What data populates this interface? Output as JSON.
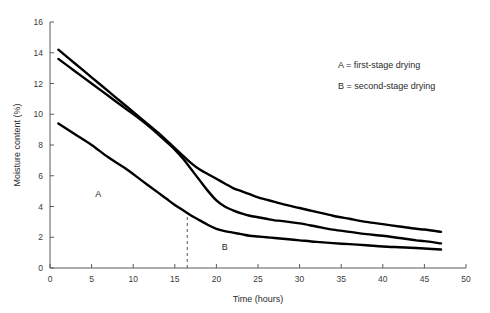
{
  "chart_data": {
    "type": "line",
    "title": "",
    "xlabel": "Time (hours)",
    "ylabel": "Moisture content (%)",
    "xlim": [
      0,
      50
    ],
    "ylim": [
      0,
      16
    ],
    "xticks": [
      0,
      5,
      10,
      15,
      20,
      25,
      30,
      35,
      40,
      45,
      50
    ],
    "xticklabels": [
      "0",
      "5",
      "10",
      "15",
      "20",
      "25",
      "30",
      "35",
      "40",
      "45",
      "50"
    ],
    "yticks": [
      0,
      2,
      4,
      6,
      8,
      10,
      12,
      14,
      16
    ],
    "yticklabels": [
      "0",
      "2",
      "4",
      "6",
      "8",
      "10",
      "12",
      "14",
      "16"
    ],
    "grid": false,
    "legend_position": "upper-right",
    "series": [
      {
        "name": "upper-curve",
        "x": [
          1,
          3,
          5,
          7,
          9,
          11,
          13,
          14,
          15,
          16,
          17,
          18,
          19,
          20,
          21,
          22,
          23,
          24,
          25,
          26,
          27,
          28,
          30,
          32,
          34,
          36,
          38,
          40,
          42,
          44,
          45,
          47
        ],
        "y": [
          14.2,
          13.3,
          12.4,
          11.5,
          10.6,
          9.7,
          8.8,
          8.3,
          7.8,
          7.3,
          6.8,
          6.4,
          6.1,
          5.8,
          5.5,
          5.2,
          5.0,
          4.8,
          4.6,
          4.45,
          4.3,
          4.15,
          3.9,
          3.65,
          3.4,
          3.2,
          3.0,
          2.85,
          2.7,
          2.55,
          2.5,
          2.35
        ]
      },
      {
        "name": "middle-curve",
        "x": [
          1,
          3,
          5,
          7,
          9,
          11,
          13,
          14,
          15,
          16,
          17,
          18,
          19,
          20,
          21,
          22,
          23,
          24,
          25,
          26,
          27,
          28,
          30,
          32,
          34,
          36,
          38,
          40,
          42,
          44,
          45,
          47
        ],
        "y": [
          13.6,
          12.8,
          12.0,
          11.2,
          10.4,
          9.6,
          8.7,
          8.2,
          7.7,
          7.1,
          6.4,
          5.7,
          5.0,
          4.4,
          4.0,
          3.75,
          3.55,
          3.4,
          3.3,
          3.2,
          3.1,
          3.05,
          2.9,
          2.7,
          2.5,
          2.35,
          2.2,
          2.1,
          1.95,
          1.8,
          1.75,
          1.6
        ]
      },
      {
        "name": "lower-curve",
        "x": [
          1,
          3,
          5,
          7,
          9,
          11,
          13,
          14,
          15,
          16,
          17,
          18,
          19,
          20,
          21,
          22,
          23,
          24,
          25,
          26,
          27,
          28,
          30,
          32,
          34,
          36,
          38,
          40,
          42,
          44,
          45,
          47
        ],
        "y": [
          9.4,
          8.7,
          8.0,
          7.2,
          6.5,
          5.7,
          4.9,
          4.5,
          4.1,
          3.75,
          3.4,
          3.1,
          2.8,
          2.55,
          2.4,
          2.3,
          2.2,
          2.1,
          2.05,
          2.0,
          1.95,
          1.9,
          1.8,
          1.7,
          1.62,
          1.55,
          1.48,
          1.4,
          1.35,
          1.3,
          1.27,
          1.2
        ]
      }
    ],
    "annotations": [
      {
        "name": "stage-a-label",
        "text": "A",
        "x": 5.8,
        "y": 4.6
      },
      {
        "name": "stage-b-label",
        "text": "B",
        "x": 21.0,
        "y": 1.15
      }
    ],
    "divider": {
      "name": "stage-divider",
      "x": 16.5,
      "y_top": 3.45,
      "y_bottom": 0
    },
    "legend": [
      {
        "key": "A",
        "text": "A = first-stage drying"
      },
      {
        "key": "B",
        "text": "B = second-stage drying"
      }
    ],
    "colors": {
      "series": "#000000",
      "axis": "#5a5a5a",
      "text": "#2a2a2a",
      "background": "#ffffff"
    }
  }
}
